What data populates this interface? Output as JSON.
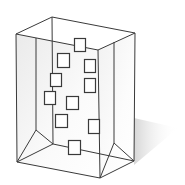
{
  "diagram": {
    "colors": {
      "background": "#ffffff",
      "edge": "#3a3a3a",
      "square_stroke": "#3a3a3a",
      "square_fill": "#ffffff",
      "face_shade_dark": "#e6e6e6",
      "face_shade_light": "#ffffff",
      "shadow": "#d9d9d9"
    },
    "box": {
      "vertices": {
        "top_front_left": [
          16,
          34
        ],
        "top_back_left": [
          52,
          17
        ],
        "top_back_right": [
          135,
          33
        ],
        "top_front_right": [
          98,
          50
        ],
        "bottom_front_left": [
          17,
          162
        ],
        "bottom_front_right": [
          100,
          178
        ],
        "bottom_back_right": [
          134,
          161
        ],
        "inner_bottom_left": [
          36,
          130
        ],
        "inner_back_bottom_left": [
          53,
          144
        ],
        "inner_back_bottom_right": [
          114,
          143
        ]
      },
      "edges": [
        [
          [
            16,
            34
          ],
          [
            52,
            17
          ]
        ],
        [
          [
            52,
            17
          ],
          [
            135,
            33
          ]
        ],
        [
          [
            16,
            34
          ],
          [
            98,
            50
          ]
        ],
        [
          [
            98,
            50
          ],
          [
            135,
            33
          ]
        ],
        [
          [
            16,
            34
          ],
          [
            17,
            162
          ]
        ],
        [
          [
            36,
            38
          ],
          [
            36,
            130
          ]
        ],
        [
          [
            52,
            17
          ],
          [
            53,
            144
          ]
        ],
        [
          [
            98,
            50
          ],
          [
            100,
            178
          ]
        ],
        [
          [
            114,
            42
          ],
          [
            114,
            143
          ]
        ],
        [
          [
            135,
            33
          ],
          [
            134,
            161
          ]
        ],
        [
          [
            17,
            162
          ],
          [
            100,
            178
          ]
        ],
        [
          [
            100,
            178
          ],
          [
            134,
            161
          ]
        ],
        [
          [
            17,
            162
          ],
          [
            36,
            130
          ]
        ],
        [
          [
            36,
            130
          ],
          [
            53,
            144
          ]
        ],
        [
          [
            17,
            162
          ],
          [
            53,
            144
          ]
        ],
        [
          [
            53,
            144
          ],
          [
            134,
            161
          ]
        ],
        [
          [
            114,
            143
          ],
          [
            134,
            161
          ]
        ],
        [
          [
            114,
            143
          ],
          [
            100,
            178
          ]
        ]
      ]
    },
    "squares": [
      {
        "x": 74,
        "y": 38,
        "w": 11,
        "h": 13
      },
      {
        "x": 57,
        "y": 53,
        "w": 12,
        "h": 14
      },
      {
        "x": 84,
        "y": 59,
        "w": 11,
        "h": 13
      },
      {
        "x": 50,
        "y": 73,
        "w": 11,
        "h": 13
      },
      {
        "x": 84,
        "y": 78,
        "w": 11,
        "h": 14
      },
      {
        "x": 44,
        "y": 91,
        "w": 11,
        "h": 13
      },
      {
        "x": 66,
        "y": 96,
        "w": 12,
        "h": 13
      },
      {
        "x": 55,
        "y": 114,
        "w": 12,
        "h": 13
      },
      {
        "x": 88,
        "y": 119,
        "w": 11,
        "h": 14
      },
      {
        "x": 68,
        "y": 140,
        "w": 12,
        "h": 14
      }
    ],
    "shadow": {
      "points": [
        [
          134,
          118
        ],
        [
          178,
          128
        ],
        [
          134,
          165
        ]
      ]
    }
  }
}
